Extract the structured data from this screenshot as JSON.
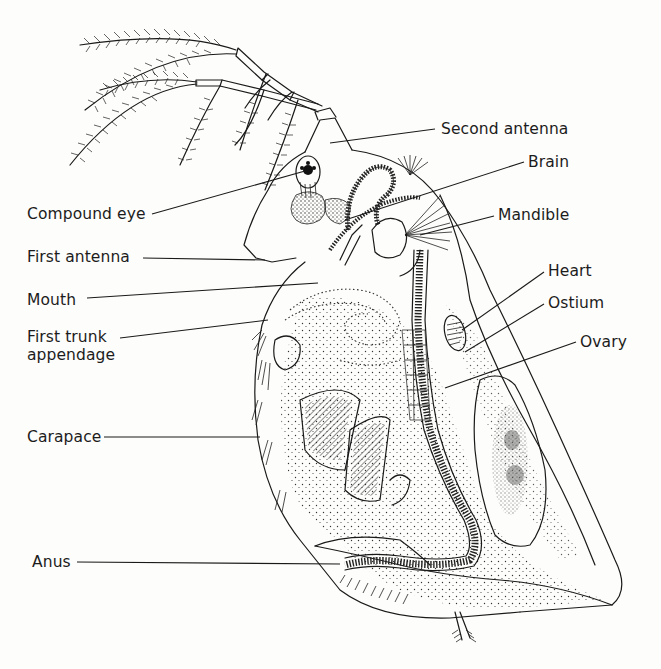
{
  "figure": {
    "background": "#fdfdfb",
    "ink_color": "#1a1a1a"
  },
  "labels": [
    {
      "id": "second-antenna",
      "text": "Second antenna",
      "x": 441,
      "y": 120,
      "line": [
        [
          435,
          129
        ],
        [
          330,
          143
        ]
      ]
    },
    {
      "id": "brain",
      "text": "Brain",
      "x": 528,
      "y": 153,
      "line": [
        [
          524,
          162
        ],
        [
          345,
          220
        ]
      ]
    },
    {
      "id": "compound-eye",
      "text": "Compound eye",
      "x": 27,
      "y": 205,
      "line": [
        [
          152,
          214
        ],
        [
          305,
          171
        ]
      ]
    },
    {
      "id": "mandible",
      "text": "Mandible",
      "x": 498,
      "y": 206,
      "line": [
        [
          494,
          216
        ],
        [
          420,
          235
        ]
      ]
    },
    {
      "id": "first-antenna",
      "text": "First antenna",
      "x": 27,
      "y": 248,
      "line": [
        [
          143,
          258
        ],
        [
          265,
          260
        ]
      ]
    },
    {
      "id": "heart",
      "text": "Heart",
      "x": 548,
      "y": 262,
      "line": [
        [
          544,
          272
        ],
        [
          465,
          330
        ]
      ]
    },
    {
      "id": "mouth",
      "text": "Mouth",
      "x": 27,
      "y": 291,
      "line": [
        [
          87,
          298
        ],
        [
          318,
          283
        ]
      ]
    },
    {
      "id": "ostium",
      "text": "Ostium",
      "x": 548,
      "y": 294,
      "line": [
        [
          544,
          304
        ],
        [
          470,
          355
        ]
      ]
    },
    {
      "id": "first-trunk-appendage",
      "text": "First trunk",
      "text2": "appendage",
      "x": 27,
      "y": 328,
      "line": [
        [
          120,
          338
        ],
        [
          268,
          320
        ]
      ]
    },
    {
      "id": "ovary",
      "text": "Ovary",
      "x": 580,
      "y": 333,
      "line": [
        [
          576,
          342
        ],
        [
          445,
          388
        ]
      ]
    },
    {
      "id": "carapace",
      "text": "Carapace",
      "x": 27,
      "y": 428,
      "line": [
        [
          104,
          437
        ],
        [
          260,
          437
        ]
      ]
    },
    {
      "id": "anus",
      "text": "Anus",
      "x": 32,
      "y": 553,
      "line": [
        [
          77,
          562
        ],
        [
          340,
          564
        ]
      ]
    }
  ]
}
